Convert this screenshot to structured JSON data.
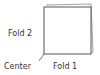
{
  "diagram": {
    "labels": {
      "fold2": "Fold 2",
      "center": "Center",
      "fold1": "Fold 1"
    },
    "colors": {
      "stroke": "#555555",
      "text": "#333333"
    }
  }
}
